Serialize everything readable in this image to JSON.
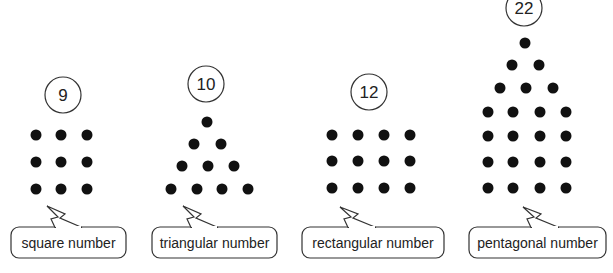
{
  "figures": [
    {
      "id": "square",
      "number": "9",
      "label": "square number",
      "circle": {
        "cx": 63,
        "cy": 95,
        "r": 18
      },
      "dots": [
        [
          36,
          135
        ],
        [
          61,
          135
        ],
        [
          87,
          135
        ],
        [
          36,
          162
        ],
        [
          61,
          162
        ],
        [
          87,
          162
        ],
        [
          36,
          189
        ],
        [
          61,
          189
        ],
        [
          87,
          189
        ]
      ],
      "bubble": {
        "x": 11,
        "y": 227,
        "w": 115,
        "h": 31,
        "tail_tip": [
          47,
          206
        ],
        "tail_base_left": 55,
        "tail_base_right": 82
      }
    },
    {
      "id": "triangular",
      "number": "10",
      "label": "triangular number",
      "circle": {
        "cx": 206,
        "cy": 84,
        "r": 18
      },
      "dots": [
        [
          207,
          122
        ],
        [
          194,
          144
        ],
        [
          221,
          144
        ],
        [
          182,
          166
        ],
        [
          208,
          166
        ],
        [
          234,
          166
        ],
        [
          171,
          189
        ],
        [
          197,
          189
        ],
        [
          222,
          189
        ],
        [
          248,
          189
        ]
      ],
      "bubble": {
        "x": 152,
        "y": 227,
        "w": 125,
        "h": 31,
        "tail_tip": [
          183,
          206
        ],
        "tail_base_left": 191,
        "tail_base_right": 218
      }
    },
    {
      "id": "rectangular",
      "number": "12",
      "label": "rectangular number",
      "circle": {
        "cx": 369,
        "cy": 92,
        "r": 18
      },
      "dots": [
        [
          332,
          135
        ],
        [
          358,
          135
        ],
        [
          384,
          135
        ],
        [
          410,
          135
        ],
        [
          332,
          161
        ],
        [
          358,
          161
        ],
        [
          384,
          161
        ],
        [
          410,
          161
        ],
        [
          332,
          188
        ],
        [
          358,
          188
        ],
        [
          384,
          188
        ],
        [
          410,
          188
        ]
      ],
      "bubble": {
        "x": 302,
        "y": 227,
        "w": 142,
        "h": 31,
        "tail_tip": [
          340,
          207
        ],
        "tail_base_left": 348,
        "tail_base_right": 376
      }
    },
    {
      "id": "pentagonal",
      "number": "22",
      "label": "pentagonal number",
      "circle": {
        "cx": 524,
        "cy": 8,
        "r": 18
      },
      "dots": [
        [
          525,
          43
        ],
        [
          512,
          65
        ],
        [
          539,
          65
        ],
        [
          500,
          88
        ],
        [
          526,
          88
        ],
        [
          553,
          88
        ],
        [
          488,
          112
        ],
        [
          513,
          112
        ],
        [
          540,
          112
        ],
        [
          566,
          112
        ],
        [
          488,
          136
        ],
        [
          513,
          136
        ],
        [
          540,
          136
        ],
        [
          566,
          136
        ],
        [
          488,
          162
        ],
        [
          513,
          162
        ],
        [
          540,
          162
        ],
        [
          566,
          162
        ],
        [
          488,
          188
        ],
        [
          513,
          188
        ],
        [
          540,
          188
        ],
        [
          566,
          188
        ]
      ],
      "bubble": {
        "x": 469,
        "y": 227,
        "w": 137,
        "h": 31,
        "tail_tip": [
          523,
          207
        ],
        "tail_base_left": 531,
        "tail_base_right": 559
      }
    }
  ],
  "style": {
    "dot_color": "#111111",
    "stroke_color": "#333333",
    "dot_radius": 5.5
  }
}
